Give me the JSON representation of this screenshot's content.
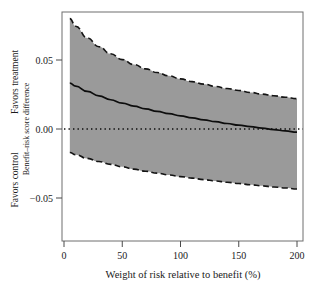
{
  "chart_data": {
    "type": "line",
    "title": "",
    "subtitle": "",
    "xlabel": "Weight of risk relative to benefit (%)",
    "ylabel": "Benefit–risk score difference",
    "ylabel_top": "Favors treatment",
    "ylabel_bottom": "Favors control",
    "xlim": [
      0,
      200
    ],
    "ylim": [
      -0.075,
      0.085
    ],
    "xticks": [
      0,
      50,
      100,
      150,
      200
    ],
    "xtick_labels": [
      "0",
      "50",
      "100",
      "150",
      "200"
    ],
    "yticks": [
      0.05,
      0.0,
      -0.05
    ],
    "ytick_labels": [
      "0.05",
      "0.00",
      "−0.05"
    ],
    "grid": false,
    "legend": "none",
    "reference_line": {
      "y": 0.0,
      "style": "dotted",
      "label": "zero difference"
    },
    "zero_crossing_x": 105,
    "x": [
      5,
      10,
      20,
      30,
      40,
      50,
      60,
      70,
      80,
      90,
      100,
      110,
      120,
      130,
      140,
      150,
      160,
      170,
      180,
      190,
      200
    ],
    "series": [
      {
        "name": "Upper 95% confidence limit",
        "style": "dashed",
        "values": [
          0.08,
          0.0745,
          0.066,
          0.0596,
          0.0545,
          0.0503,
          0.0467,
          0.0436,
          0.0409,
          0.0385,
          0.0363,
          0.0343,
          0.0325,
          0.0308,
          0.0293,
          0.0279,
          0.0265,
          0.0253,
          0.0241,
          0.023,
          0.022
        ]
      },
      {
        "name": "Benefit-risk score difference estimate",
        "style": "solid",
        "values": [
          0.0332,
          0.031,
          0.0272,
          0.024,
          0.0212,
          0.0188,
          0.0166,
          0.0146,
          0.0128,
          0.0111,
          0.0095,
          0.008,
          0.0066,
          0.0053,
          0.004,
          0.0028,
          0.0017,
          0.0006,
          -0.0004,
          -0.0014,
          -0.0023
        ]
      },
      {
        "name": "Lower 95% confidence limit",
        "style": "dashed",
        "values": [
          -0.017,
          -0.0186,
          -0.0213,
          -0.0236,
          -0.0256,
          -0.0274,
          -0.0291,
          -0.0306,
          -0.032,
          -0.0333,
          -0.0345,
          -0.0356,
          -0.0367,
          -0.0377,
          -0.0386,
          -0.0395,
          -0.0404,
          -0.0412,
          -0.042,
          -0.0427,
          -0.0435
        ]
      }
    ],
    "band": {
      "name": "95% confidence band",
      "fill_color": "#9a9a9a",
      "upper_series": "Upper 95% confidence limit",
      "lower_series": "Lower 95% confidence limit"
    },
    "colors": {
      "band_fill": "#9a9a9a",
      "line": "#0d0d0d",
      "frame": "#6e6e6e",
      "text": "#1a1a1a",
      "background": "#ffffff"
    }
  }
}
